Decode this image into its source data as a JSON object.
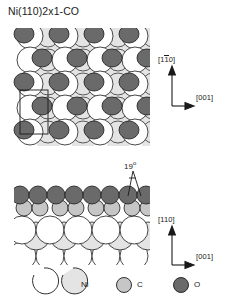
{
  "figure": {
    "title": "Ni(110)2x1-CO",
    "type": "surface-structure-diagram",
    "panels": [
      {
        "name": "top-view",
        "axes": {
          "vertical": "[110]",
          "vertical_overbar_index": 1,
          "horizontal": "[001]"
        },
        "unit_cell": "2x1"
      },
      {
        "name": "side-view",
        "axes": {
          "vertical": "[110]",
          "vertical_overbar_index": -1,
          "horizontal": "[001]"
        },
        "annotation": {
          "value": "19",
          "unit": "°",
          "label": "19°"
        }
      }
    ]
  },
  "axes": {
    "top_vertical_a": "[1",
    "top_vertical_b": "1",
    "top_vertical_c": "0]",
    "top_horizontal": "[001]",
    "bottom_vertical": "[110]",
    "bottom_horizontal": "[001]"
  },
  "angle": {
    "value": "19",
    "degree_symbol": "o"
  },
  "legend": {
    "items": [
      {
        "key": "ni",
        "label": "Ni",
        "swatch": "two-open-circles",
        "colors": [
          "#ffffff",
          "#e2e2e2"
        ]
      },
      {
        "key": "c",
        "label": "C",
        "swatch": "filled-circle",
        "colors": [
          "#c6c6c6"
        ]
      },
      {
        "key": "o",
        "label": "O",
        "swatch": "filled-circle",
        "colors": [
          "#6a6a6a"
        ]
      }
    ],
    "ni_label": "Ni",
    "c_label": "C",
    "o_label": "O"
  },
  "colors": {
    "ni_top": "#ffffff",
    "ni_sub": "#e4e4e4",
    "carbon": "#c6c6c6",
    "oxygen": "#6a6a6a",
    "stroke": "#1a1a1a",
    "background": "#ffffff"
  }
}
